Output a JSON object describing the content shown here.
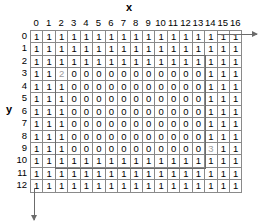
{
  "chart_data": {
    "type": "heatmap",
    "title": "",
    "xlabel": "x",
    "ylabel": "y",
    "grid": true,
    "legend": "none",
    "x_tick_labels": [
      "0",
      "1",
      "2",
      "3",
      "4",
      "5",
      "6",
      "7",
      "8",
      "9",
      "10",
      "11",
      "12",
      "13",
      "14",
      "15",
      "16"
    ],
    "y_tick_labels": [
      "0",
      "1",
      "2",
      "3",
      "4",
      "5",
      "6",
      "7",
      "8",
      "9",
      "10",
      "11",
      "12"
    ],
    "xlim": [
      0,
      16
    ],
    "ylim": [
      0,
      12
    ],
    "cell_values": [
      [
        "1",
        "1",
        "1",
        "1",
        "1",
        "1",
        "1",
        "1",
        "1",
        "1",
        "1",
        "1",
        "1",
        "1",
        "1",
        "1",
        "1"
      ],
      [
        "1",
        "1",
        "1",
        "1",
        "1",
        "1",
        "1",
        "1",
        "1",
        "1",
        "1",
        "1",
        "1",
        "1",
        "1",
        "1",
        "1"
      ],
      [
        "1",
        "1",
        "1",
        "1",
        "1",
        "1",
        "1",
        "1",
        "1",
        "1",
        "1",
        "1",
        "1",
        "1",
        "1",
        "1",
        "1"
      ],
      [
        "1",
        "1",
        "2",
        "0",
        "0",
        "0",
        "0",
        "0",
        "0",
        "0",
        "0",
        "0",
        "0",
        "0",
        "1",
        "1",
        "1"
      ],
      [
        "1",
        "1",
        "1",
        "0",
        "0",
        "0",
        "0",
        "0",
        "0",
        "0",
        "0",
        "0",
        "0",
        "0",
        "1",
        "1",
        "1"
      ],
      [
        "1",
        "1",
        "1",
        "0",
        "0",
        "0",
        "0",
        "0",
        "0",
        "0",
        "0",
        "0",
        "0",
        "0",
        "1",
        "1",
        "1"
      ],
      [
        "1",
        "1",
        "1",
        "0",
        "0",
        "0",
        "0",
        "0",
        "0",
        "0",
        "0",
        "0",
        "0",
        "0",
        "1",
        "1",
        "1"
      ],
      [
        "1",
        "1",
        "1",
        "0",
        "0",
        "0",
        "0",
        "0",
        "0",
        "0",
        "0",
        "0",
        "0",
        "0",
        "1",
        "1",
        "1"
      ],
      [
        "1",
        "1",
        "1",
        "0",
        "0",
        "0",
        "0",
        "0",
        "0",
        "0",
        "0",
        "0",
        "0",
        "0",
        "1",
        "1",
        "1"
      ],
      [
        "1",
        "1",
        "1",
        "0",
        "0",
        "0",
        "0",
        "0",
        "0",
        "0",
        "0",
        "0",
        "0",
        "0",
        "3",
        "1",
        "1"
      ],
      [
        "1",
        "1",
        "1",
        "1",
        "1",
        "1",
        "1",
        "1",
        "1",
        "1",
        "1",
        "1",
        "1",
        "1",
        "1",
        "1",
        "1"
      ],
      [
        "1",
        "1",
        "1",
        "1",
        "1",
        "1",
        "1",
        "1",
        "1",
        "1",
        "1",
        "1",
        "1",
        "1",
        "1",
        "1",
        "1"
      ],
      [
        "1",
        "1",
        "1",
        "1",
        "1",
        "1",
        "1",
        "1",
        "1",
        "1",
        "1",
        "1",
        "1",
        "1",
        "1",
        "1",
        "1"
      ]
    ],
    "annotations": [
      {
        "name": "start-marker",
        "value": "2",
        "x": 2,
        "y": 3,
        "color": "#9a9a9a"
      },
      {
        "name": "end-marker",
        "value": "3",
        "x": 14,
        "y": 9,
        "color": "#9a9a9a"
      }
    ],
    "region_box": {
      "x_start": 2,
      "x_end": 14,
      "y_start": 2,
      "y_end": 10,
      "color": "#6b6b6b"
    },
    "axis_arrows": {
      "x_arrow_direction": "right",
      "y_arrow_direction": "down",
      "color": "#6b6b6b"
    }
  }
}
